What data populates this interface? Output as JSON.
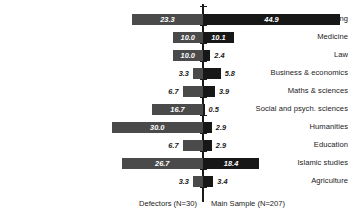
{
  "chart_data": {
    "type": "bar",
    "orientation": "horizontal",
    "style": "diverging-pyramid",
    "title": "",
    "subtitle": "",
    "xlabel": "",
    "ylabel": "",
    "categories": [
      "Engineering",
      "Medicine",
      "Law",
      "Business & economics",
      "Maths & sciences",
      "Social and psych. sciences",
      "Humanities",
      "Education",
      "Islamic studies",
      "Agriculture"
    ],
    "series": [
      {
        "name": "Defectors (N=30)",
        "side": "left",
        "color": "#4a4a4a",
        "values": [
          23.3,
          10.0,
          10.0,
          3.3,
          6.7,
          16.7,
          30.0,
          6.7,
          26.7,
          3.3
        ]
      },
      {
        "name": "Main Sample (N=207)",
        "side": "right",
        "color": "#171717",
        "values": [
          44.9,
          10.1,
          2.4,
          5.8,
          3.9,
          0.5,
          2.9,
          2.9,
          18.4,
          3.4
        ]
      }
    ],
    "value_labels_left": [
      "23.3",
      "10.0",
      "10.0",
      "3.3",
      "6.7",
      "16.7",
      "30.0",
      "6.7",
      "26.7",
      "3.3"
    ],
    "value_labels_right": [
      "44.9",
      "10.1",
      "2.4",
      "5.8",
      "3.9",
      "0.5",
      "2.9",
      "2.9",
      "18.4",
      "3.4"
    ],
    "xlim": [
      0,
      46
    ],
    "grid": false,
    "legend_position": "bottom",
    "axis_center_label": ""
  },
  "captions": {
    "left": "Defectors (N=30)",
    "right": "Main Sample (N=207)"
  },
  "colors": {
    "left_bar": "#4a4a4a",
    "right_bar": "#171717",
    "axis": "#1a1a1a",
    "background": "#ffffff",
    "label_inside": "#ffffff",
    "label_outside": "#1a1a1a"
  }
}
